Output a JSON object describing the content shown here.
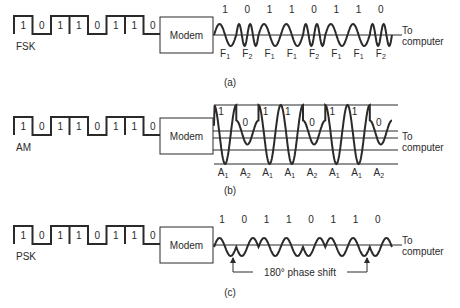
{
  "bits": [
    "1",
    "0",
    "1",
    "1",
    "0",
    "1",
    "1",
    "0"
  ],
  "modem_label": "Modem",
  "output_label_line1": "To",
  "output_label_line2": "computer",
  "colors": {
    "ink": "#2a2a2a",
    "grid": "#555555",
    "background": "#ffffff"
  },
  "panels": [
    {
      "id": "fsk",
      "name": "FSK",
      "caption": "(a)",
      "wave_bits": [
        "1",
        "0",
        "1",
        "1",
        "0",
        "1",
        "1",
        "0"
      ],
      "symbols": [
        "F1",
        "F2",
        "F1",
        "F1",
        "F2",
        "F1",
        "F1",
        "F2"
      ]
    },
    {
      "id": "am",
      "name": "AM",
      "caption": "(b)",
      "wave_bits": [
        "1",
        "0",
        "1",
        "1",
        "0",
        "1",
        "1",
        "0"
      ],
      "symbols": [
        "A1",
        "A2",
        "A1",
        "A1",
        "A2",
        "A1",
        "A1",
        "A2"
      ]
    },
    {
      "id": "psk",
      "name": "PSK",
      "caption": "(c)",
      "wave_bits": [
        "1",
        "0",
        "1",
        "1",
        "0",
        "1",
        "1",
        "0"
      ],
      "annotation": "180° phase shift"
    }
  ]
}
